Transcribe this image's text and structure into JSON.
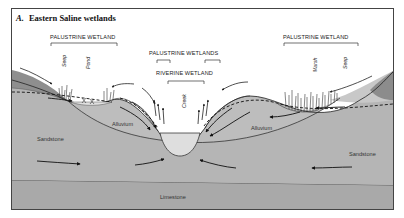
{
  "figure": {
    "title_prefix": "A.",
    "title": "Eastern Saline wetlands"
  },
  "wetland_labels": {
    "palustrine_left": "PALUSTRINE WETLAND",
    "palustrine_center": "PALUSTRINE WETLANDS",
    "riverine": "RIVERINE WETLAND",
    "palustrine_right": "PALUSTRINE WETLAND"
  },
  "feature_labels": {
    "seep_left": "Seep",
    "pond": "Pond",
    "creek": "Creek",
    "marsh": "Marsh",
    "seep_right": "Seep"
  },
  "geology_labels": {
    "sandstone_left": "Sandstone",
    "alluvium_left": "Alluvium",
    "alluvium_right": "Alluvium",
    "sandstone_right": "Sandstone",
    "limestone": "Limestone"
  },
  "colors": {
    "frame": "#444444",
    "upland_dark": "#8f8f8f",
    "upland_light": "#c9c9c9",
    "sandstone": "#b3b3b3",
    "alluvium": "#bdbdbd",
    "limestone": "#aaaaaa",
    "water": "#dcdcdc",
    "background": "#ffffff"
  }
}
